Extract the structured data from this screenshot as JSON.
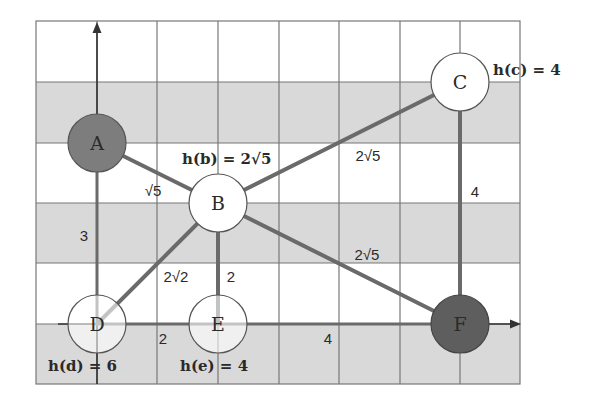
{
  "diagram": {
    "type": "weighted-graph-on-grid",
    "grid": {
      "columns": 8,
      "rows": 6,
      "shaded_rows": [
        2,
        4,
        6
      ],
      "colors": {
        "grid_line": "#6e6e6e",
        "shaded": "#d9d9d9",
        "background": "#ffffff",
        "edge": "#6a6a6a",
        "node_filled": "#7d7d7d"
      }
    },
    "nodes": [
      {
        "id": "A",
        "label": "A",
        "filled": true
      },
      {
        "id": "B",
        "label": "B",
        "filled": false
      },
      {
        "id": "C",
        "label": "C",
        "filled": false
      },
      {
        "id": "D",
        "label": "D",
        "filled": false
      },
      {
        "id": "E",
        "label": "E",
        "filled": false
      },
      {
        "id": "F",
        "label": "F",
        "filled": true
      }
    ],
    "edges": [
      {
        "from": "A",
        "to": "B",
        "label": "√5"
      },
      {
        "from": "A",
        "to": "D",
        "label": "3"
      },
      {
        "from": "B",
        "to": "C",
        "label": "2√5"
      },
      {
        "from": "B",
        "to": "D",
        "label": "2√2"
      },
      {
        "from": "B",
        "to": "E",
        "label": "2"
      },
      {
        "from": "B",
        "to": "F",
        "label": "2√5"
      },
      {
        "from": "C",
        "to": "F",
        "label": "4"
      },
      {
        "from": "D",
        "to": "E",
        "label": "2"
      },
      {
        "from": "E",
        "to": "F",
        "label": "4"
      }
    ],
    "heuristics": {
      "b": "h(b) = 2√5",
      "c": "h(c) = 4",
      "d": "h(d) = 6",
      "e": "h(e) = 4"
    },
    "axes": {
      "x_arrow": true,
      "y_arrow": true
    }
  }
}
